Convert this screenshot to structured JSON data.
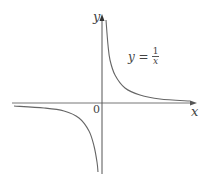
{
  "chart_data": {
    "type": "line",
    "title": "",
    "xlabel": "x",
    "ylabel": "y",
    "origin_label": "0",
    "annotation": {
      "lhs": "y =",
      "numerator": "1",
      "denominator": "x"
    },
    "function": "y = 1/x",
    "grid": false,
    "legend": null,
    "series": [
      {
        "name": "y = 1/x (x>0)",
        "points_px": [
          [
            106,
            20
          ],
          [
            108,
            45
          ],
          [
            110,
            60
          ],
          [
            115,
            75
          ],
          [
            125,
            88
          ],
          [
            140,
            95
          ],
          [
            160,
            99
          ],
          [
            190,
            101
          ]
        ]
      },
      {
        "name": "y = 1/x (x<0)",
        "points_px": [
          [
            14,
            106
          ],
          [
            44,
            108
          ],
          [
            64,
            111
          ],
          [
            79,
            118
          ],
          [
            89,
            131
          ],
          [
            94,
            146
          ],
          [
            97,
            162
          ],
          [
            98,
            172
          ]
        ]
      }
    ],
    "colors": {
      "curve": "#555555",
      "axis": "#555555"
    }
  },
  "labels": {
    "y_axis": "y",
    "x_axis": "x",
    "origin": "0",
    "eq_lhs": "y =",
    "eq_num": "1",
    "eq_den": "x"
  }
}
